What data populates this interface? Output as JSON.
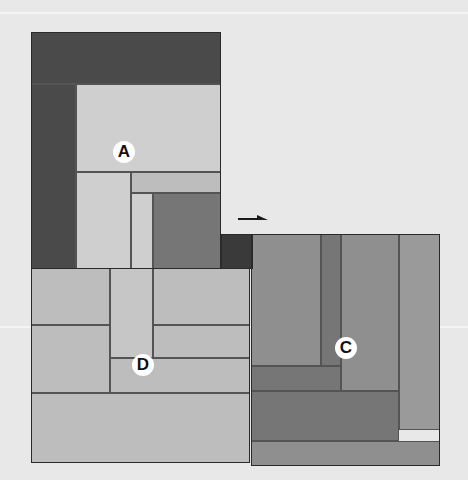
{
  "canvas": {
    "width": 468,
    "height": 480,
    "background_color": "#e8e8e8",
    "scanline_color": "#f4f4f4",
    "outline_color": "#2a2a2a",
    "seam_color": "#545454"
  },
  "scanlines": [
    {
      "name": "scanline-top",
      "y": 12
    },
    {
      "name": "scanline-middle",
      "y": 326
    }
  ],
  "palette": {
    "very_dark": "#4a4a4a",
    "dark": "#3a3a3a",
    "mid_dark": "#767676",
    "mid": "#8f8f8f",
    "mid_light": "#9a9a9a",
    "light": "#bdbdbd",
    "very_light": "#cfcfcf",
    "pale": "#c6c6c6"
  },
  "groups": [
    {
      "id": "A",
      "name": "group-a",
      "label": "A",
      "label_x": 113,
      "label_y": 141,
      "x": 31,
      "y": 32,
      "width": 190,
      "height": 237,
      "pieces": [
        {
          "name": "piece-a-top-band",
          "x": 31,
          "y": 32,
          "width": 190,
          "height": 52,
          "color": "#4a4a4a"
        },
        {
          "name": "piece-a-left-column",
          "x": 31,
          "y": 84,
          "width": 45,
          "height": 185,
          "color": "#4a4a4a"
        },
        {
          "name": "piece-a-main-field",
          "x": 76,
          "y": 84,
          "width": 145,
          "height": 88,
          "color": "#cfcfcf"
        },
        {
          "name": "piece-a-mid-right",
          "x": 131,
          "y": 172,
          "width": 90,
          "height": 21,
          "color": "#bdbdbd"
        },
        {
          "name": "piece-a-mid-left",
          "x": 76,
          "y": 172,
          "width": 55,
          "height": 97,
          "color": "#cfcfcf"
        },
        {
          "name": "piece-a-inner-strip",
          "x": 131,
          "y": 193,
          "width": 22,
          "height": 76,
          "color": "#cfcfcf"
        },
        {
          "name": "piece-a-dark-block",
          "x": 153,
          "y": 193,
          "width": 68,
          "height": 76,
          "color": "#767676"
        }
      ]
    },
    {
      "id": "B",
      "name": "group-b",
      "label": "",
      "x": 221,
      "y": 234,
      "width": 32,
      "height": 35,
      "pieces": [
        {
          "name": "piece-b-dark-notch",
          "x": 221,
          "y": 234,
          "width": 32,
          "height": 35,
          "color": "#3a3a3a"
        }
      ]
    },
    {
      "id": "C",
      "name": "group-c",
      "label": "C",
      "label_x": 335,
      "label_y": 337,
      "x": 251,
      "y": 234,
      "width": 189,
      "height": 232,
      "pieces": [
        {
          "name": "piece-c-left-field",
          "x": 251,
          "y": 234,
          "width": 70,
          "height": 132,
          "color": "#8f8f8f"
        },
        {
          "name": "piece-c-center-strip",
          "x": 321,
          "y": 234,
          "width": 20,
          "height": 132,
          "color": "#767676"
        },
        {
          "name": "piece-c-upper-right",
          "x": 341,
          "y": 234,
          "width": 58,
          "height": 157,
          "color": "#8f8f8f"
        },
        {
          "name": "piece-c-right-column",
          "x": 399,
          "y": 234,
          "width": 41,
          "height": 196,
          "color": "#9a9a9a"
        },
        {
          "name": "piece-c-lower-bar",
          "x": 251,
          "y": 366,
          "width": 90,
          "height": 25,
          "color": "#767676"
        },
        {
          "name": "piece-c-lower-field",
          "x": 251,
          "y": 391,
          "width": 148,
          "height": 50,
          "color": "#767676"
        },
        {
          "name": "piece-c-bottom-band",
          "x": 251,
          "y": 441,
          "width": 189,
          "height": 25,
          "color": "#8f8f8f"
        }
      ]
    },
    {
      "id": "D",
      "name": "group-d",
      "label": "D",
      "label_x": 132,
      "label_y": 354,
      "x": 31,
      "y": 268,
      "width": 219,
      "height": 195,
      "pieces": [
        {
          "name": "piece-d-left-upper",
          "x": 31,
          "y": 268,
          "width": 79,
          "height": 57,
          "color": "#bdbdbd"
        },
        {
          "name": "piece-d-left-lower",
          "x": 31,
          "y": 325,
          "width": 79,
          "height": 68,
          "color": "#bdbdbd"
        },
        {
          "name": "piece-d-center-strip",
          "x": 110,
          "y": 268,
          "width": 43,
          "height": 90,
          "color": "#c6c6c6"
        },
        {
          "name": "piece-d-right-upper",
          "x": 153,
          "y": 268,
          "width": 97,
          "height": 57,
          "color": "#bdbdbd"
        },
        {
          "name": "piece-d-right-mid",
          "x": 153,
          "y": 325,
          "width": 97,
          "height": 33,
          "color": "#bdbdbd"
        },
        {
          "name": "piece-d-mid-bar",
          "x": 110,
          "y": 358,
          "width": 140,
          "height": 35,
          "color": "#bdbdbd"
        },
        {
          "name": "piece-d-bottom-band",
          "x": 31,
          "y": 393,
          "width": 219,
          "height": 70,
          "color": "#bdbdbd"
        }
      ]
    }
  ],
  "arrow": {
    "name": "direction-arrow",
    "direction": "right",
    "x": 238,
    "y": 214,
    "width": 30,
    "height": 10,
    "color": "#1a1a1a"
  }
}
